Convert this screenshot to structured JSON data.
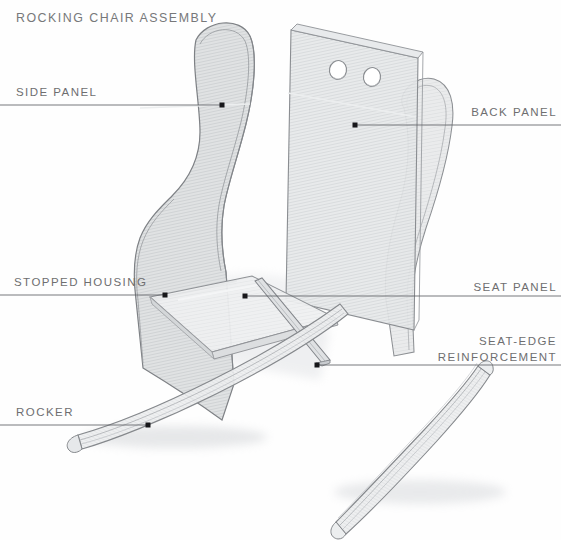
{
  "document": {
    "title": "Rocking Chair Assembly",
    "type": "exploded-assembly-drawing",
    "medium": "pencil-rendered technical illustration",
    "background_color": "#fefefe",
    "label_color": "#6e6e70",
    "leader_color": "#58585a",
    "dot_color": "#1d1d1f"
  },
  "labels": [
    {
      "id": "side-panel",
      "text": "Side Panel",
      "align": "left",
      "text_x": 16,
      "text_y": 85,
      "line_x1": 0,
      "line_y1": 105,
      "line_x2": 222,
      "line_y2": 105,
      "dot_x": 222,
      "dot_y": 105
    },
    {
      "id": "back-panel",
      "text": "Back Panel",
      "align": "right",
      "text_x": 557,
      "text_y": 105,
      "line_x1": 561,
      "line_y1": 125,
      "line_x2": 355,
      "line_y2": 125,
      "dot_x": 355,
      "dot_y": 125
    },
    {
      "id": "stopped-housing",
      "text": "Stopped Housing",
      "align": "left",
      "text_x": 14,
      "text_y": 275,
      "line_x1": 0,
      "line_y1": 295,
      "line_x2": 165,
      "line_y2": 295,
      "dot_x": 165,
      "dot_y": 295
    },
    {
      "id": "seat-panel",
      "text": "Seat Panel",
      "align": "right",
      "text_x": 557,
      "text_y": 280,
      "line_x1": 561,
      "line_y1": 296,
      "line_x2": 245,
      "line_y2": 296,
      "dot_x": 245,
      "dot_y": 296
    },
    {
      "id": "seat-edge-reinforcement",
      "text": "Seat-edge",
      "text2": "Reinforcement",
      "align": "right",
      "text_x": 557,
      "text_y": 334,
      "line_x1": 561,
      "line_y1": 365,
      "line_x2": 317,
      "line_y2": 365,
      "dot_x": 317,
      "dot_y": 365
    },
    {
      "id": "rocker",
      "text": "Rocker",
      "align": "left",
      "text_x": 16,
      "text_y": 405,
      "line_x1": 0,
      "line_y1": 425,
      "line_x2": 148,
      "line_y2": 425,
      "dot_x": 148,
      "dot_y": 425
    }
  ],
  "parts": [
    {
      "name": "Side Panel",
      "count": 2,
      "description": "curved S-profile plywood side with wing top"
    },
    {
      "name": "Back Panel",
      "count": 1,
      "description": "rectangular panel with two round holes near top"
    },
    {
      "name": "Seat Panel",
      "count": 1,
      "description": "flat panel shown in perspective"
    },
    {
      "name": "Seat-edge Reinforcement",
      "count": 1,
      "description": "narrow batten along front seat edge"
    },
    {
      "name": "Rocker",
      "count": 2,
      "description": "laminated curved runner"
    },
    {
      "name": "Stopped Housing",
      "count": 1,
      "description": "routed groove joint in side panel"
    }
  ]
}
